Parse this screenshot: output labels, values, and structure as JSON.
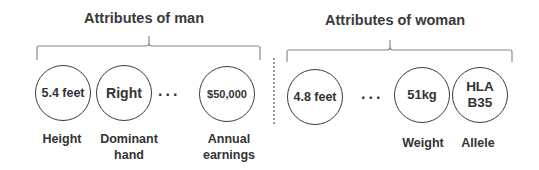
{
  "groups": {
    "man": {
      "title": "Attributes of man",
      "attributes": [
        {
          "value": "5.4 feet",
          "label": "Height"
        },
        {
          "value": "Right",
          "label": "Dominant hand"
        },
        {
          "value": "$50,000",
          "label": "Annual earnings"
        }
      ],
      "ellipsis": "..."
    },
    "woman": {
      "title": "Attributes of woman",
      "attributes": [
        {
          "value": "4.8 feet",
          "label": ""
        },
        {
          "value": "51kg",
          "label": "Weight"
        },
        {
          "value": "HLA B35",
          "label": "Allele"
        }
      ],
      "ellipsis": "..."
    }
  },
  "labels_split": {
    "dominant_hand_line1": "Dominant",
    "dominant_hand_line2": "hand",
    "annual_earnings_line1": "Annual",
    "annual_earnings_line2": "earnings",
    "hla_line1": "HLA",
    "hla_line2": "B35"
  },
  "colors": {
    "stroke": "#3a3a3a",
    "background": "#ffffff"
  }
}
